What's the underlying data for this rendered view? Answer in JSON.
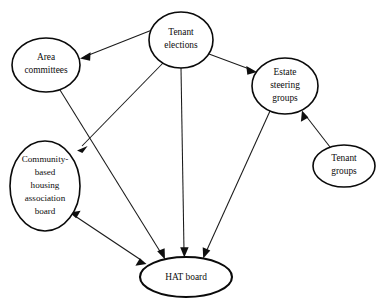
{
  "diagram": {
    "background_color": "#ffffff",
    "stroke_color": "#0f0f0f",
    "canvas": {
      "width": 380,
      "height": 308
    },
    "nodes": [
      {
        "id": "tenant-elections",
        "label": "Tenant elections",
        "lines": [
          "Tenant",
          "elections"
        ],
        "cx": 181,
        "cy": 40,
        "rx": 32,
        "ry": 28,
        "emphasis": "normal"
      },
      {
        "id": "area-committees",
        "label": "Area committees",
        "lines": [
          "Area",
          "committees"
        ],
        "cx": 46,
        "cy": 65,
        "rx": 34,
        "ry": 27,
        "emphasis": "normal"
      },
      {
        "id": "estate-steering-groups",
        "label": "Estate steering groups",
        "lines": [
          "Estate",
          "steering",
          "groups"
        ],
        "cx": 285,
        "cy": 86,
        "rx": 33,
        "ry": 28,
        "emphasis": "normal"
      },
      {
        "id": "tenant-groups",
        "label": "Tenant groups",
        "lines": [
          "Tenant",
          "groups"
        ],
        "cx": 344,
        "cy": 166,
        "rx": 31,
        "ry": 21,
        "emphasis": "normal"
      },
      {
        "id": "community-based-housing-association-board",
        "label": "Community-based housing association board",
        "lines": [
          "Community-",
          "based",
          "housing",
          "association",
          "board"
        ],
        "cx": 45,
        "cy": 186,
        "rx": 35,
        "ry": 45,
        "emphasis": "normal"
      },
      {
        "id": "hat-board",
        "label": "HAT board",
        "lines": [
          "HAT board"
        ],
        "cx": 186,
        "cy": 277,
        "rx": 46,
        "ry": 20,
        "emphasis": "thick"
      }
    ],
    "edges": [
      {
        "id": "tenant-elections-to-area-committees",
        "from": "tenant-elections",
        "to": "area-committees",
        "direction": "one-way",
        "x1": 152,
        "y1": 30,
        "x2": 80,
        "y2": 58
      },
      {
        "id": "tenant-elections-to-estate-steering-groups",
        "from": "tenant-elections",
        "to": "estate-steering-groups",
        "direction": "one-way",
        "x1": 209,
        "y1": 54,
        "x2": 257,
        "y2": 72
      },
      {
        "id": "tenant-elections-to-community-based-board",
        "from": "tenant-elections",
        "to": "community-based-housing-association-board",
        "direction": "one-way",
        "x1": 163,
        "y1": 63,
        "x2": 77,
        "y2": 150
      },
      {
        "id": "tenant-elections-to-hat-board",
        "from": "tenant-elections",
        "to": "hat-board",
        "direction": "one-way",
        "x1": 181,
        "y1": 68,
        "x2": 184,
        "y2": 256
      },
      {
        "id": "area-committees-to-hat-board",
        "from": "area-committees",
        "to": "hat-board",
        "direction": "one-way",
        "x1": 60,
        "y1": 90,
        "x2": 165,
        "y2": 259
      },
      {
        "id": "estate-steering-groups-to-hat-board",
        "from": "estate-steering-groups",
        "to": "hat-board",
        "direction": "one-way",
        "x1": 270,
        "y1": 111,
        "x2": 203,
        "y2": 258
      },
      {
        "id": "tenant-groups-to-estate-steering-groups",
        "from": "tenant-groups",
        "to": "estate-steering-groups",
        "direction": "one-way",
        "x1": 330,
        "y1": 147,
        "x2": 302,
        "y2": 111
      },
      {
        "id": "community-based-board-and-hat-board",
        "from": "community-based-housing-association-board",
        "to": "hat-board",
        "direction": "two-way",
        "x1": 70,
        "y1": 213,
        "x2": 145,
        "y2": 263
      }
    ]
  }
}
